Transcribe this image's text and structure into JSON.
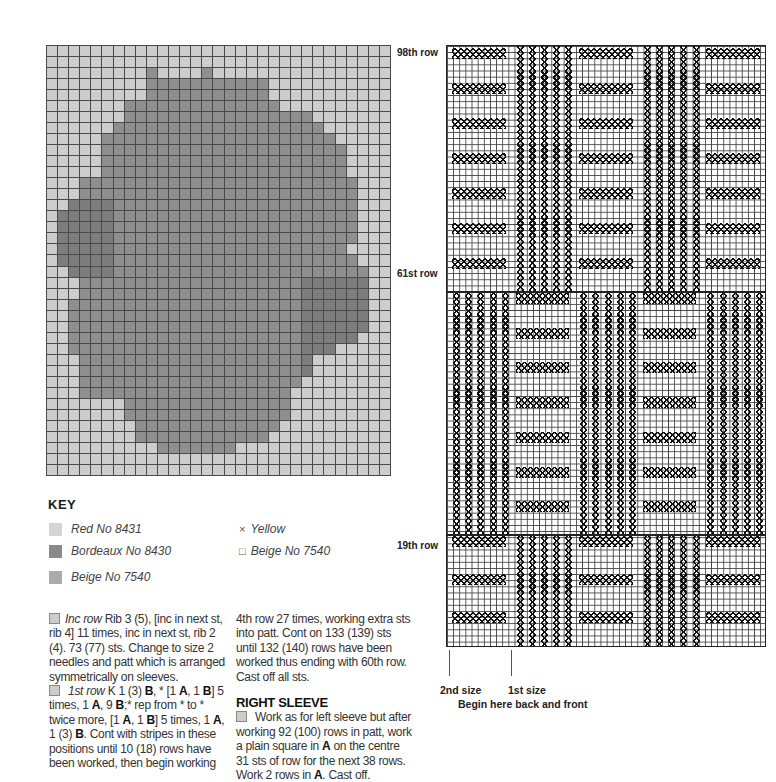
{
  "key": {
    "title": "KEY",
    "items": [
      {
        "label": "Red No 8431",
        "swatch": "#d4d4d4",
        "symbol": ""
      },
      {
        "label": "Bordeaux No 8430",
        "swatch": "#8a8a8a",
        "symbol": ""
      },
      {
        "label": "Beige No 7540",
        "swatch": "#ababab",
        "symbol": ""
      },
      {
        "label": "Yellow",
        "swatch": "",
        "symbol": "×"
      },
      {
        "label": "Beige No 7540",
        "swatch": "",
        "symbol": "□"
      }
    ]
  },
  "rose_chart": {
    "cols": 31,
    "rows": 39,
    "dark_spans": [
      [],
      [],
      [
        [
          9,
          9
        ],
        [
          14,
          14
        ]
      ],
      [
        [
          9,
          13
        ],
        [
          14,
          16
        ],
        [
          17,
          19
        ]
      ],
      [
        [
          9,
          19
        ]
      ],
      [
        [
          7,
          20
        ]
      ],
      [
        [
          7,
          23
        ]
      ],
      [
        [
          6,
          24
        ]
      ],
      [
        [
          5,
          25
        ]
      ],
      [
        [
          5,
          26
        ]
      ],
      [
        [
          5,
          26
        ]
      ],
      [
        [
          5,
          26
        ]
      ],
      [
        [
          3,
          27
        ]
      ],
      [
        [
          3,
          27
        ]
      ],
      [
        [
          2,
          27
        ]
      ],
      [
        [
          1,
          27
        ]
      ],
      [
        [
          1,
          27
        ]
      ],
      [
        [
          1,
          27
        ]
      ],
      [
        [
          1,
          26
        ]
      ],
      [
        [
          1,
          27
        ]
      ],
      [
        [
          2,
          28
        ]
      ],
      [
        [
          3,
          28
        ]
      ],
      [
        [
          3,
          28
        ]
      ],
      [
        [
          2,
          28
        ]
      ],
      [
        [
          2,
          28
        ]
      ],
      [
        [
          2,
          28
        ]
      ],
      [
        [
          2,
          27
        ]
      ],
      [
        [
          2,
          25
        ]
      ],
      [
        [
          3,
          23
        ]
      ],
      [
        [
          3,
          23
        ]
      ],
      [
        [
          3,
          22
        ]
      ],
      [
        [
          3,
          21
        ]
      ],
      [
        [
          7,
          21
        ]
      ],
      [
        [
          7,
          21
        ]
      ],
      [
        [
          8,
          20
        ]
      ],
      [
        [
          8,
          19
        ]
      ],
      [
        [
          10,
          16
        ]
      ],
      [],
      []
    ]
  },
  "text": {
    "col1": {
      "p1_italic": "Inc row",
      "p1": "Rib 3 (5), [inc in next st, rib 4] 11 times, inc in next st, rib 2 (4). 73 (77) sts. Change to size 2 needles and patt which is arranged symmetrically on sleeves.",
      "p2_italic": "1st row",
      "p2_a": "K 1 (3) ",
      "p2_b": "B",
      "p2_c": ", * [1 ",
      "p2_d": "A",
      "p2_e": ", 1 ",
      "p2_f": "B",
      "p2_g": "] 5 times, 1 ",
      "p2_h": "A",
      "p2_i": ", 9 ",
      "p2_j": "B",
      "p2_k": ";* rep from * to * twice more, [1 ",
      "p2_l": "A",
      "p2_m": ", 1 ",
      "p2_n": "B",
      "p2_o": "] 5 times, 1 ",
      "p2_p": "A",
      "p2_q": ", 1 (3) ",
      "p2_r": "B",
      "p2_s": ". Cont with stripes in these positions until 10 (18) rows have been worked, then begin working"
    },
    "col2": {
      "p1": "4th row 27 times, working extra sts into patt. Cont on 133 (139) sts until 132 (140) rows have been worked thus ending with 60th row. Cast off all sts.",
      "section_title": "RIGHT SLEEVE",
      "p2_a": "Work as for left sleeve but after working 92 (100) rows in patt, work a plain square in ",
      "p2_b": "A",
      "p2_c": " on the centre 31 sts of row for the next 38 rows. Work 2 rows in ",
      "p2_d": "A",
      "p2_e": ". Cast off."
    }
  },
  "stitch_chart": {
    "row_labels": [
      {
        "label": "98th row",
        "y": 47
      },
      {
        "label": "61st row",
        "y": 268
      },
      {
        "label": "19th row",
        "y": 540
      }
    ],
    "bands": [
      {
        "top": 0,
        "height": 245,
        "pattern": [
          "H",
          "V",
          "H",
          "V",
          "H"
        ],
        "stripes": 7
      },
      {
        "top": 245,
        "height": 243,
        "pattern": [
          "V",
          "H",
          "V",
          "H",
          "V"
        ],
        "stripes": 7
      },
      {
        "top": 488,
        "height": 114,
        "pattern": [
          "H",
          "V",
          "H",
          "V",
          "H"
        ],
        "stripes": 3
      }
    ],
    "size_markers": [
      {
        "label": "2nd size",
        "x": 449
      },
      {
        "label": "1st size",
        "x": 511
      }
    ],
    "caption": "Begin here back and front"
  }
}
